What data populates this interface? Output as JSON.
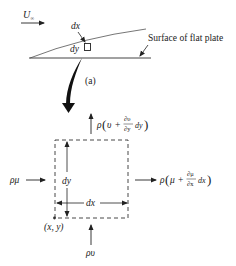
{
  "figure": {
    "freestream_label": "U",
    "freestream_subscript": "∞",
    "element_dx_label": "dx",
    "element_dy_label": "dy",
    "surface_label": "Surface of flat plate",
    "panel_label": "(a)"
  },
  "control_volume": {
    "top_flux": {
      "rho": "ρ",
      "open": "(",
      "var": "υ",
      "plus": "+",
      "deriv_num": "∂υ",
      "deriv_den": "∂y",
      "diff": "dy",
      "close": ")"
    },
    "right_flux": {
      "rho": "ρ",
      "open": "(",
      "var": "μ",
      "plus": "+",
      "deriv_num": "∂μ",
      "deriv_den": "∂x",
      "diff": "dx",
      "close": ")"
    },
    "left_flux": "ρμ",
    "bottom_flux": "ρυ",
    "height_label": "dy",
    "width_label": "dx",
    "origin_label": "(x, y)"
  },
  "colors": {
    "stroke": "#222222",
    "boundary_layer": "#555555"
  }
}
